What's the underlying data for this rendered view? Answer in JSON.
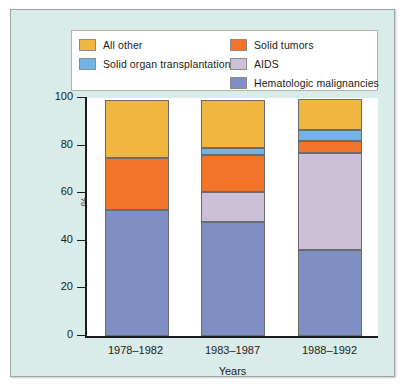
{
  "chart_data": {
    "type": "bar",
    "subtype": "stacked-bar-100",
    "title": "",
    "xlabel": "Years",
    "ylabel": "%",
    "ylim": [
      0,
      100
    ],
    "yticks": [
      0,
      20,
      40,
      60,
      80,
      100
    ],
    "grid": false,
    "legend_position": "top",
    "categories": [
      "1978–1982",
      "1983–1987",
      "1988–1992"
    ],
    "series": [
      {
        "name": "Hematologic malignancies",
        "color": "#7f8fc4",
        "values": [
          53,
          48,
          36
        ]
      },
      {
        "name": "AIDS",
        "color": "#ccc0d8",
        "values": [
          0,
          12.5,
          41
        ]
      },
      {
        "name": "Solid tumors",
        "color": "#f2742a",
        "values": [
          22,
          15.5,
          5
        ]
      },
      {
        "name": "Solid organ transplantations",
        "color": "#73b4e4",
        "values": [
          0,
          3,
          4.5
        ]
      },
      {
        "name": "All other",
        "color": "#f0b640",
        "values": [
          24,
          20,
          13
        ]
      }
    ]
  },
  "legend": {
    "columns": [
      {
        "entries": [
          {
            "label": "All other",
            "color": "#f0b640"
          },
          {
            "label": "Solid organ transplantations",
            "color": "#73b4e4"
          }
        ]
      },
      {
        "entries": [
          {
            "label": "Solid tumors",
            "color": "#f2742a"
          },
          {
            "label": "AIDS",
            "color": "#ccc0d8"
          },
          {
            "label": "Hematologic malignancies",
            "color": "#7f8fc4"
          }
        ]
      }
    ]
  },
  "colors": {
    "figure_background": "#d9ecea",
    "plot_background": "#ffffff",
    "axis": "#1b1b1b",
    "segment_border": "#6b6b6b"
  }
}
